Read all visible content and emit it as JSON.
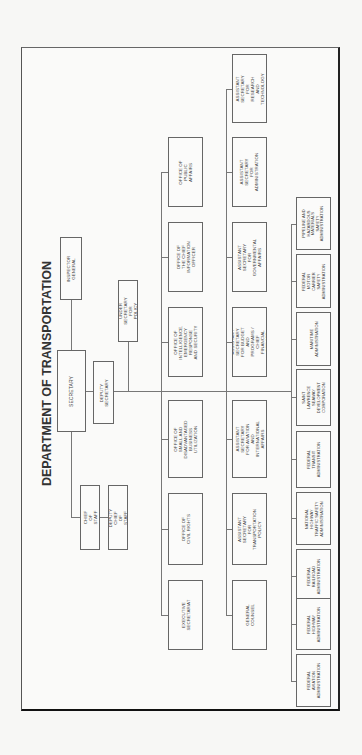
{
  "document": {
    "title": "DEPARTMENT OF TRANSPORTATION",
    "orientation": "rotated 90 degrees counter-clockwise"
  },
  "leadership": {
    "secretary": "SECRETARY",
    "inspector_general": "INSPECTOR GENERAL",
    "deputy_secretary": "DEPUTY SECRETARY",
    "under_secretary": "UNDER SECRETARY\nFOR POLICY",
    "chief_of_staff": "CHIEF OF STAFF",
    "deputy_chief_of_staff": "DEPUTY CHIEF\nOF STAFF"
  },
  "offices": [
    "OFFICE OF\nPUBLIC AFFAIRS",
    "OFFICE OF THE CHIEF\nINFORMATION OFFICER",
    "OFFICE OF\nINTELLIGENCE,\nEMERGENCY RESPONSE\nAND SECURITY",
    "OFFICE OF SMALL AND\nDISADVANTAGED\nBUSINESS UTILIZATION",
    "OFFICE OF\nCIVIL RIGHTS",
    "EXECUTIVE\nSECRETARIAT"
  ],
  "assistant_secretaries": [
    "ASSISTANT SECRETARY\nFOR RESEARCH AND\nTECHNOLOGY",
    "ASSISTANT SECRETARY\nFOR ADMINISTRATION",
    "ASSISTANT SECRETARY\nFOR GOVERNMENTAL\nAFFAIRS",
    "ASSISTANT SECRETARY\nFOR BUDGET AND\nPROGRAMS / CHIEF\nFINANCIAL OFFICER",
    "ASSISTANT SECRETARY\nFOR AVIATION AND\nINTERNATIONAL AFFAIRS",
    "ASSISTANT SECRETARY\nFOR TRANSPORTATION\nPOLICY",
    "GENERAL\nCOUNSEL"
  ],
  "administrations": [
    "PIPELINE AND\nHAZARDOUS\nMATERIALS\nSAFETY\nADMINISTRATION",
    "FEDERAL MOTOR\nCARRIER SAFETY\nADMINISTRATION",
    "MARITIME\nADMINISTRATION",
    "SAINT LAWRENCE\nSEAWAY\nDEVELOPMENT\nCORPORATION",
    "FEDERAL\nTRANSIT\nADMINISTRATION",
    "NATIONAL\nHIGHWAY\nTRAFFIC SAFETY\nADMINISTRATION",
    "FEDERAL\nRAILROAD\nADMINISTRATION",
    "FEDERAL\nHIGHWAY\nADMINISTRATION",
    "FEDERAL\nAVIATION\nADMINISTRATION"
  ]
}
